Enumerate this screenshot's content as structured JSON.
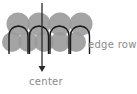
{
  "diagram": {
    "title": "",
    "labels": {
      "edge_row": "edge row",
      "center": "center"
    },
    "colors": {
      "circle_fill": "#9a9a9a",
      "loop_stroke": "#1a1a1a",
      "arrow_stroke": "#2a2a2a",
      "label_text": "#8a8a8a"
    },
    "rows": [
      {
        "name": "upper-row",
        "circle_count": 4
      },
      {
        "name": "edge-row",
        "circle_count": 5
      }
    ],
    "loop_count": 4,
    "arrow": {
      "direction": "down",
      "points_to": "center"
    }
  }
}
